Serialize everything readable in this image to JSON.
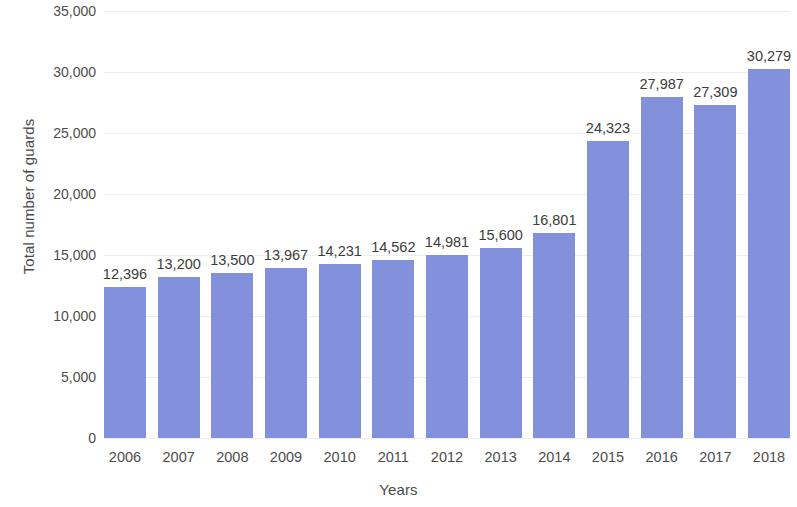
{
  "chart_data": {
    "type": "bar",
    "title": "",
    "xlabel": "Years",
    "ylabel": "Total number of guards",
    "categories": [
      "2006",
      "2007",
      "2008",
      "2009",
      "2010",
      "2011",
      "2012",
      "2013",
      "2014",
      "2015",
      "2016",
      "2017",
      "2018"
    ],
    "values": [
      12396,
      13200,
      13500,
      13967,
      14231,
      14562,
      14981,
      15600,
      16801,
      24323,
      27987,
      27309,
      30279
    ],
    "value_labels": [
      "12,396",
      "13,200",
      "13,500",
      "13,967",
      "14,231",
      "14,562",
      "14,981",
      "15,600",
      "16,801",
      "24,323",
      "27,987",
      "27,309",
      "30,279"
    ],
    "ylim": [
      0,
      35000
    ],
    "ytick_values": [
      0,
      5000,
      10000,
      15000,
      20000,
      25000,
      30000,
      35000
    ],
    "ytick_labels": [
      "0",
      "5,000",
      "10,000",
      "15,000",
      "20,000",
      "25,000",
      "30,000",
      "35,000"
    ],
    "grid": true,
    "legend": "none",
    "bar_color": "#8390dc",
    "gridline_color": "#ededed",
    "background_color": "#ffffff",
    "text_color": "#3c3c3c"
  }
}
